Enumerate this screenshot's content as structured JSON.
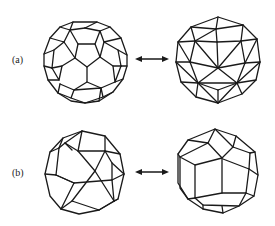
{
  "figure": {
    "rows": [
      {
        "label": "(a)",
        "left": {
          "name": "truncated icosahedron"
        },
        "relation": "double-headed arrow",
        "right": {
          "name": "pentakis dodecahedron"
        }
      },
      {
        "label": "(b)",
        "left": {
          "name": "snub cube"
        },
        "relation": "double-headed arrow",
        "right": {
          "name": "pentagonal icositetrahedron"
        }
      }
    ],
    "colors": {
      "line": "#1a1a1a",
      "background": "#ffffff"
    }
  }
}
